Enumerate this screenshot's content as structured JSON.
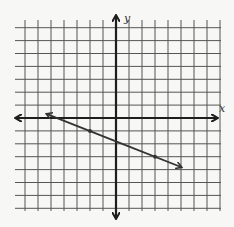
{
  "chart_data": {
    "type": "line",
    "title": "",
    "xlabel": "x",
    "ylabel": "y",
    "xlim": [
      -7,
      8
    ],
    "ylim": [
      -7,
      7
    ],
    "grid": true,
    "grid_step": 1,
    "tick_labels": false,
    "series": [
      {
        "name": "line",
        "points": [
          {
            "x": -2,
            "y": -1
          },
          {
            "x": 3,
            "y": -3
          }
        ],
        "slope": -0.4,
        "y_intercept": -1.8,
        "extent": {
          "x_start": -5.3,
          "y_start": 0.3,
          "x_end": 5,
          "y_end": -3.8
        },
        "arrows": "both",
        "color": "#333333"
      }
    ]
  },
  "labels": {
    "x_axis": "x",
    "y_axis": "y"
  },
  "colors": {
    "background": "#f7f7f5",
    "grid": "#555555",
    "axis": "#1e1e1e",
    "line": "#333333"
  }
}
